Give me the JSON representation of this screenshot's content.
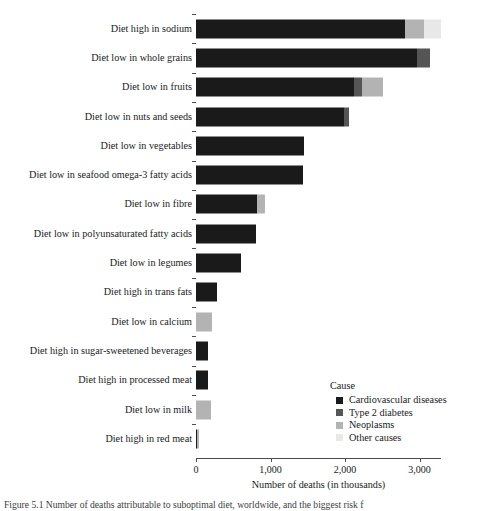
{
  "chart_data": {
    "type": "bar",
    "orientation": "horizontal",
    "stacked": true,
    "title": "",
    "xlabel": "Number of deaths (in thousands)",
    "ylabel": "",
    "xlim": [
      0,
      3300
    ],
    "xticks": [
      0,
      1000,
      2000,
      3000
    ],
    "xtick_labels": [
      "0",
      "1,000",
      "2,000",
      "3,000"
    ],
    "grid": false,
    "legend_position": "inside-lower-right",
    "legend_title": "Cause",
    "series": [
      {
        "name": "Cardiovascular diseases",
        "color": "#1a1a1a",
        "values": [
          2800,
          2970,
          2120,
          1990,
          1450,
          1440,
          820,
          810,
          600,
          280,
          0,
          160,
          160,
          0,
          20
        ]
      },
      {
        "name": "Type 2 diabetes",
        "color": "#555555",
        "values": [
          0,
          175,
          105,
          60,
          0,
          0,
          0,
          0,
          0,
          0,
          0,
          0,
          0,
          0,
          0
        ]
      },
      {
        "name": "Neoplasms",
        "color": "#b3b3b3",
        "values": [
          265,
          0,
          280,
          0,
          0,
          0,
          105,
          0,
          0,
          0,
          215,
          0,
          0,
          200,
          20
        ]
      },
      {
        "name": "Other causes",
        "color": "#e8e8e8",
        "values": [
          230,
          0,
          0,
          0,
          0,
          0,
          0,
          0,
          0,
          0,
          0,
          0,
          0,
          0,
          0
        ]
      }
    ],
    "categories": [
      "Diet high in sodium",
      "Diet low in whole grains",
      "Diet low in fruits",
      "Diet low in nuts and seeds",
      "Diet low in vegetables",
      "Diet low in seafood omega-3 fatty acids",
      "Diet low in fibre",
      "Diet low in polyunsaturated fatty acids",
      "Diet low in legumes",
      "Diet high in trans fats",
      "Diet low in calcium",
      "Diet high in sugar-sweetened beverages",
      "Diet high in processed meat",
      "Diet low in milk",
      "Diet high in red meat"
    ],
    "totals": [
      3295,
      3145,
      2505,
      2050,
      1450,
      1440,
      925,
      810,
      600,
      280,
      215,
      160,
      160,
      200,
      40
    ]
  },
  "axis": {
    "x_title": "Number of deaths (in thousands)",
    "tick_labels": [
      "0",
      "1,000",
      "2,000",
      "3,000"
    ]
  },
  "legend": {
    "title": "Cause",
    "items": [
      {
        "label": "Cardiovascular diseases",
        "color": "#1a1a1a"
      },
      {
        "label": "Type 2 diabetes",
        "color": "#555555"
      },
      {
        "label": "Neoplasms",
        "color": "#b3b3b3"
      },
      {
        "label": "Other causes",
        "color": "#e8e8e8"
      }
    ]
  },
  "caption": {
    "text": "Figure 5.1  Number of deaths attributable to suboptimal diet, worldwide, and the biggest risk f"
  }
}
